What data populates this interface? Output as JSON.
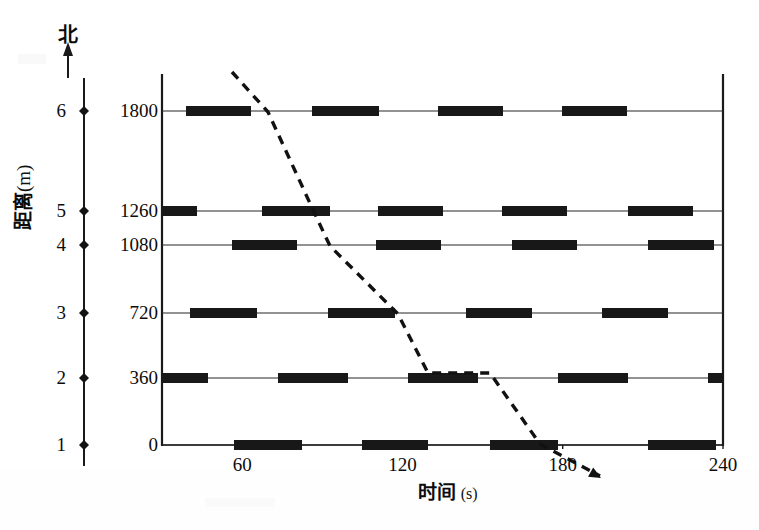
{
  "figure": {
    "north_label": "北",
    "y_axis_title_main": "距离",
    "y_axis_title_unit": "(m)",
    "x_axis_title_main": "时间",
    "x_axis_title_unit": "(s)"
  },
  "chart_data": {
    "type": "table",
    "title": "",
    "xlabel": "时间 (s)",
    "ylabel": "距离 (m)",
    "xlim": [
      30,
      240
    ],
    "ylim": [
      0,
      1800
    ],
    "grid": false,
    "legend": "none",
    "x_ticks": [
      "60",
      "120",
      "180",
      "240"
    ],
    "x_tick_values": [
      60,
      120,
      180,
      240
    ],
    "stations": [
      {
        "no": "6",
        "distance": "1800",
        "distance_value": 1800,
        "y_px": 111
      },
      {
        "no": "5",
        "distance": "1260",
        "distance_value": 1260,
        "y_px": 211
      },
      {
        "no": "4",
        "distance": "1080",
        "distance_value": 1080,
        "y_px": 245
      },
      {
        "no": "3",
        "distance": "720",
        "distance_value": 720,
        "y_px": 313
      },
      {
        "no": "2",
        "distance": "360",
        "distance_value": 360,
        "y_px": 378
      },
      {
        "no": "1",
        "distance": "0",
        "distance_value": 0,
        "y_px": 445
      }
    ],
    "series": [
      {
        "name": "station-6-occupancy",
        "station_no": "6",
        "y_px": 111,
        "bars_px": [
          [
            186,
            251
          ],
          [
            312,
            379
          ],
          [
            438,
            503
          ],
          [
            562,
            627
          ]
        ]
      },
      {
        "name": "station-5-occupancy",
        "station_no": "5",
        "y_px": 211,
        "bars_px": [
          [
            162,
            197
          ],
          [
            262,
            330
          ],
          [
            378,
            443
          ],
          [
            502,
            567
          ],
          [
            628,
            693
          ]
        ]
      },
      {
        "name": "station-4-occupancy",
        "station_no": "4",
        "y_px": 245,
        "bars_px": [
          [
            232,
            297
          ],
          [
            376,
            441
          ],
          [
            512,
            577
          ],
          [
            648,
            714
          ]
        ]
      },
      {
        "name": "station-3-occupancy",
        "station_no": "3",
        "y_px": 313,
        "bars_px": [
          [
            190,
            257
          ],
          [
            328,
            395
          ],
          [
            466,
            532
          ],
          [
            602,
            668
          ]
        ]
      },
      {
        "name": "station-2-occupancy",
        "station_no": "2",
        "y_px": 378,
        "bars_px": [
          [
            162,
            208
          ],
          [
            278,
            348
          ],
          [
            408,
            478
          ],
          [
            558,
            628
          ],
          [
            708,
            723
          ]
        ]
      },
      {
        "name": "station-1-occupancy",
        "station_no": "1",
        "y_px": 445,
        "bars_px": [
          [
            234,
            302
          ],
          [
            362,
            428
          ],
          [
            490,
            558
          ],
          [
            648,
            716
          ]
        ]
      }
    ],
    "trajectory": {
      "name": "vehicle-trajectory",
      "style": "dashed",
      "points_px": [
        [
          232,
          72
        ],
        [
          268,
          112
        ],
        [
          314,
          212
        ],
        [
          330,
          246
        ],
        [
          398,
          314
        ],
        [
          428,
          373
        ],
        [
          490,
          373
        ],
        [
          540,
          444
        ],
        [
          600,
          476
        ]
      ],
      "has_arrow_head": true,
      "arrow_tip_px": [
        601,
        478
      ]
    }
  }
}
